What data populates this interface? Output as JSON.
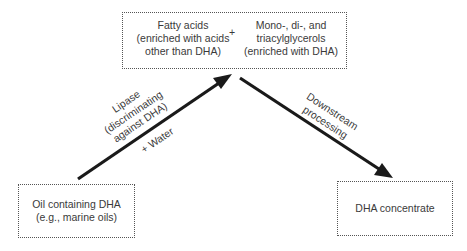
{
  "diagram": {
    "top_box": {
      "left_text": [
        "Fatty acids",
        "(enriched with acids",
        "other than DHA)"
      ],
      "plus": "+",
      "right_text": [
        "Mono-, di-, and",
        "triacylglycerols",
        "(enriched with DHA)"
      ]
    },
    "source_box": {
      "lines": [
        "Oil containing DHA",
        "(e.g., marine oils)"
      ]
    },
    "product_box": {
      "lines": [
        "DHA concentrate"
      ]
    },
    "arrows": [
      {
        "from": "source_box",
        "to": "top_box",
        "label_above": [
          "Lipase",
          "(discriminating",
          "against DHA)"
        ],
        "label_below": "+ Water"
      },
      {
        "from": "top_box",
        "to": "product_box",
        "label_above": [
          "Downstream",
          "processing"
        ]
      }
    ],
    "colors": {
      "arrow": "#1a1a1a",
      "border": "#555555",
      "text": "#3a3a3a"
    }
  }
}
